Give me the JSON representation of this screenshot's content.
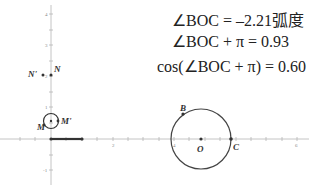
{
  "formulas": {
    "line1": "∠BOC = –2.21弧度",
    "line2": "∠BOC + π = 0.93",
    "line3": "cos(∠BOC + π) = 0.60"
  },
  "axes": {
    "x_tick_labels": [
      "2",
      "4",
      "6"
    ],
    "y_tick_labels": [
      "4",
      "3",
      "2",
      "1",
      "-1"
    ]
  },
  "points": {
    "N": "N",
    "N_prime": "N'",
    "M": "M",
    "M_prime": "M'",
    "B": "B",
    "O": "O",
    "C": "C"
  },
  "colors": {
    "axis": "#aaaaaa",
    "stroke": "#444444",
    "text": "#222222"
  }
}
